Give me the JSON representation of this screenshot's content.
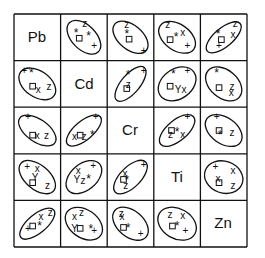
{
  "chart_data": {
    "type": "scatter",
    "subtype": "scatterplot-matrix-with-confidence-ellipses",
    "title": "",
    "variables": [
      "Pb",
      "Cd",
      "Cr",
      "Ti",
      "Zn"
    ],
    "grid": {
      "rows": 5,
      "cols": 5,
      "origin": [
        14,
        14
      ],
      "cell_size": 46.6
    },
    "marker_legend": [
      "+",
      "*",
      "x",
      "z",
      "square",
      "Y"
    ],
    "cells": [
      {
        "row": 0,
        "col": 1,
        "ellipse": {
          "cx": 0.5,
          "cy": 0.5,
          "rx": 0.44,
          "ry": 0.26,
          "angle": 45
        },
        "points": [
          {
            "m": "z",
            "x": 0.52,
            "y": 0.2
          },
          {
            "m": "*",
            "x": 0.33,
            "y": 0.42
          },
          {
            "m": "square",
            "x": 0.4,
            "y": 0.52
          },
          {
            "m": "*",
            "x": 0.6,
            "y": 0.48
          },
          {
            "m": "+",
            "x": 0.72,
            "y": 0.67
          }
        ]
      },
      {
        "row": 0,
        "col": 2,
        "ellipse": {
          "cx": 0.5,
          "cy": 0.5,
          "rx": 0.44,
          "ry": 0.26,
          "angle": 40
        },
        "points": [
          {
            "m": "z",
            "x": 0.42,
            "y": 0.22
          },
          {
            "m": "*",
            "x": 0.42,
            "y": 0.45
          },
          {
            "m": "square",
            "x": 0.47,
            "y": 0.54
          },
          {
            "m": "+",
            "x": 0.78,
            "y": 0.78
          }
        ]
      },
      {
        "row": 0,
        "col": 3,
        "ellipse": {
          "cx": 0.5,
          "cy": 0.5,
          "rx": 0.44,
          "ry": 0.28,
          "angle": 35
        },
        "points": [
          {
            "m": "z",
            "x": 0.3,
            "y": 0.22
          },
          {
            "m": "square",
            "x": 0.35,
            "y": 0.55
          },
          {
            "m": "*",
            "x": 0.48,
            "y": 0.5
          },
          {
            "m": "x",
            "x": 0.62,
            "y": 0.4
          },
          {
            "m": "+",
            "x": 0.72,
            "y": 0.68
          }
        ]
      },
      {
        "row": 0,
        "col": 4,
        "ellipse": {
          "cx": 0.5,
          "cy": 0.5,
          "rx": 0.46,
          "ry": 0.2,
          "angle": -40
        },
        "points": [
          {
            "m": "z",
            "x": 0.75,
            "y": 0.2
          },
          {
            "m": "x",
            "x": 0.7,
            "y": 0.45
          },
          {
            "m": "*",
            "x": 0.38,
            "y": 0.45
          },
          {
            "m": "square",
            "x": 0.45,
            "y": 0.55
          },
          {
            "m": "+",
            "x": 0.4,
            "y": 0.68
          }
        ]
      },
      {
        "row": 1,
        "col": 0,
        "ellipse": {
          "cx": 0.5,
          "cy": 0.5,
          "rx": 0.44,
          "ry": 0.28,
          "angle": 35
        },
        "points": [
          {
            "m": "+",
            "x": 0.22,
            "y": 0.22
          },
          {
            "m": "*",
            "x": 0.37,
            "y": 0.28
          },
          {
            "m": "square",
            "x": 0.4,
            "y": 0.55
          },
          {
            "m": "x",
            "x": 0.52,
            "y": 0.62
          },
          {
            "m": "z",
            "x": 0.75,
            "y": 0.55
          }
        ]
      },
      {
        "row": 1,
        "col": 2,
        "ellipse": {
          "cx": 0.5,
          "cy": 0.5,
          "rx": 0.46,
          "ry": 0.2,
          "angle": -50
        },
        "points": [
          {
            "m": "*",
            "x": 0.45,
            "y": 0.32
          },
          {
            "m": "z",
            "x": 0.45,
            "y": 0.52
          },
          {
            "m": "square",
            "x": 0.42,
            "y": 0.6
          },
          {
            "m": "+",
            "x": 0.78,
            "y": 0.22
          }
        ]
      },
      {
        "row": 1,
        "col": 3,
        "ellipse": {
          "cx": 0.5,
          "cy": 0.5,
          "rx": 0.44,
          "ry": 0.32,
          "angle": -35
        },
        "points": [
          {
            "m": "+",
            "x": 0.72,
            "y": 0.22
          },
          {
            "m": "*",
            "x": 0.42,
            "y": 0.3
          },
          {
            "m": "square",
            "x": 0.35,
            "y": 0.55
          },
          {
            "m": "Y",
            "x": 0.52,
            "y": 0.62
          },
          {
            "m": "x",
            "x": 0.65,
            "y": 0.62
          }
        ]
      },
      {
        "row": 1,
        "col": 4,
        "ellipse": {
          "cx": 0.5,
          "cy": 0.5,
          "rx": 0.44,
          "ry": 0.3,
          "angle": 40
        },
        "points": [
          {
            "m": "*",
            "x": 0.35,
            "y": 0.28
          },
          {
            "m": "square",
            "x": 0.4,
            "y": 0.58
          },
          {
            "m": "z",
            "x": 0.68,
            "y": 0.55
          },
          {
            "m": "x",
            "x": 0.66,
            "y": 0.68
          }
        ]
      },
      {
        "row": 2,
        "col": 0,
        "ellipse": {
          "cx": 0.5,
          "cy": 0.5,
          "rx": 0.46,
          "ry": 0.24,
          "angle": 35
        },
        "points": [
          {
            "m": "+",
            "x": 0.3,
            "y": 0.2
          },
          {
            "m": "square",
            "x": 0.4,
            "y": 0.6
          },
          {
            "m": "x",
            "x": 0.5,
            "y": 0.6
          },
          {
            "m": "z",
            "x": 0.7,
            "y": 0.6
          }
        ]
      },
      {
        "row": 2,
        "col": 1,
        "ellipse": {
          "cx": 0.5,
          "cy": 0.5,
          "rx": 0.46,
          "ry": 0.2,
          "angle": -40
        },
        "points": [
          {
            "m": "+",
            "x": 0.75,
            "y": 0.2
          },
          {
            "m": "x",
            "x": 0.3,
            "y": 0.62
          },
          {
            "m": "square",
            "x": 0.42,
            "y": 0.6
          },
          {
            "m": "z",
            "x": 0.5,
            "y": 0.62
          },
          {
            "m": "*",
            "x": 0.68,
            "y": 0.6
          }
        ]
      },
      {
        "row": 2,
        "col": 3,
        "ellipse": {
          "cx": 0.5,
          "cy": 0.5,
          "rx": 0.46,
          "ry": 0.22,
          "angle": -40
        },
        "points": [
          {
            "m": "+",
            "x": 0.72,
            "y": 0.2
          },
          {
            "m": "square",
            "x": 0.38,
            "y": 0.5
          },
          {
            "m": "z",
            "x": 0.36,
            "y": 0.58
          },
          {
            "m": "*",
            "x": 0.5,
            "y": 0.55
          },
          {
            "m": "x",
            "x": 0.62,
            "y": 0.58
          }
        ]
      },
      {
        "row": 2,
        "col": 4,
        "ellipse": {
          "cx": 0.5,
          "cy": 0.5,
          "rx": 0.44,
          "ry": 0.28,
          "angle": 35
        },
        "points": [
          {
            "m": "+",
            "x": 0.35,
            "y": 0.2
          },
          {
            "m": "square",
            "x": 0.4,
            "y": 0.5
          },
          {
            "m": "*",
            "x": 0.42,
            "y": 0.6
          },
          {
            "m": "z",
            "x": 0.68,
            "y": 0.55
          }
        ]
      },
      {
        "row": 3,
        "col": 0,
        "ellipse": {
          "cx": 0.5,
          "cy": 0.5,
          "rx": 0.46,
          "ry": 0.26,
          "angle": 40
        },
        "points": [
          {
            "m": "+",
            "x": 0.28,
            "y": 0.28
          },
          {
            "m": "x",
            "x": 0.5,
            "y": 0.32
          },
          {
            "m": "Y",
            "x": 0.45,
            "y": 0.5
          },
          {
            "m": "square",
            "x": 0.4,
            "y": 0.62
          },
          {
            "m": "z",
            "x": 0.72,
            "y": 0.68
          }
        ]
      },
      {
        "row": 3,
        "col": 1,
        "ellipse": {
          "cx": 0.5,
          "cy": 0.5,
          "rx": 0.44,
          "ry": 0.28,
          "angle": -40
        },
        "points": [
          {
            "m": "+",
            "x": 0.7,
            "y": 0.25
          },
          {
            "m": "x",
            "x": 0.38,
            "y": 0.35
          },
          {
            "m": "Y",
            "x": 0.35,
            "y": 0.55
          },
          {
            "m": "z",
            "x": 0.48,
            "y": 0.58
          },
          {
            "m": "*",
            "x": 0.6,
            "y": 0.55
          }
        ]
      },
      {
        "row": 3,
        "col": 2,
        "ellipse": {
          "cx": 0.5,
          "cy": 0.5,
          "rx": 0.46,
          "ry": 0.22,
          "angle": -45
        },
        "points": [
          {
            "m": "+",
            "x": 0.78,
            "y": 0.22
          },
          {
            "m": "x",
            "x": 0.38,
            "y": 0.42
          },
          {
            "m": "square",
            "x": 0.35,
            "y": 0.55
          },
          {
            "m": "*",
            "x": 0.42,
            "y": 0.58
          },
          {
            "m": "z",
            "x": 0.4,
            "y": 0.68
          }
        ]
      },
      {
        "row": 3,
        "col": 4,
        "ellipse": {
          "cx": 0.5,
          "cy": 0.5,
          "rx": 0.42,
          "ry": 0.34,
          "angle": 20
        },
        "points": [
          {
            "m": "+",
            "x": 0.32,
            "y": 0.28
          },
          {
            "m": "x",
            "x": 0.7,
            "y": 0.35
          },
          {
            "m": "x",
            "x": 0.38,
            "y": 0.52
          },
          {
            "m": "square",
            "x": 0.4,
            "y": 0.62
          },
          {
            "m": "z",
            "x": 0.7,
            "y": 0.68
          }
        ]
      },
      {
        "row": 4,
        "col": 0,
        "ellipse": {
          "cx": 0.5,
          "cy": 0.5,
          "rx": 0.46,
          "ry": 0.2,
          "angle": -40
        },
        "points": [
          {
            "m": "z",
            "x": 0.78,
            "y": 0.25
          },
          {
            "m": "x",
            "x": 0.58,
            "y": 0.35
          },
          {
            "m": "square",
            "x": 0.4,
            "y": 0.55
          },
          {
            "m": "*",
            "x": 0.55,
            "y": 0.55
          },
          {
            "m": "+",
            "x": 0.3,
            "y": 0.6
          }
        ]
      },
      {
        "row": 4,
        "col": 1,
        "ellipse": {
          "cx": 0.5,
          "cy": 0.5,
          "rx": 0.44,
          "ry": 0.3,
          "angle": 35
        },
        "points": [
          {
            "m": "x",
            "x": 0.3,
            "y": 0.35
          },
          {
            "m": "z",
            "x": 0.45,
            "y": 0.25
          },
          {
            "m": "Y",
            "x": 0.3,
            "y": 0.6
          },
          {
            "m": "square",
            "x": 0.42,
            "y": 0.6
          },
          {
            "m": "*",
            "x": 0.65,
            "y": 0.62
          },
          {
            "m": "+",
            "x": 0.72,
            "y": 0.64
          }
        ]
      },
      {
        "row": 4,
        "col": 2,
        "ellipse": {
          "cx": 0.5,
          "cy": 0.5,
          "rx": 0.44,
          "ry": 0.28,
          "angle": 40
        },
        "points": [
          {
            "m": "z",
            "x": 0.3,
            "y": 0.28
          },
          {
            "m": "x",
            "x": 0.32,
            "y": 0.35
          },
          {
            "m": "square",
            "x": 0.35,
            "y": 0.58
          },
          {
            "m": "*",
            "x": 0.45,
            "y": 0.6
          },
          {
            "m": "+",
            "x": 0.72,
            "y": 0.7
          }
        ]
      },
      {
        "row": 4,
        "col": 3,
        "ellipse": {
          "cx": 0.5,
          "cy": 0.5,
          "rx": 0.44,
          "ry": 0.32,
          "angle": 30
        },
        "points": [
          {
            "m": "z",
            "x": 0.35,
            "y": 0.3
          },
          {
            "m": "x",
            "x": 0.62,
            "y": 0.32
          },
          {
            "m": "square",
            "x": 0.4,
            "y": 0.55
          },
          {
            "m": "*",
            "x": 0.5,
            "y": 0.55
          },
          {
            "m": "+",
            "x": 0.68,
            "y": 0.65
          }
        ]
      }
    ]
  }
}
